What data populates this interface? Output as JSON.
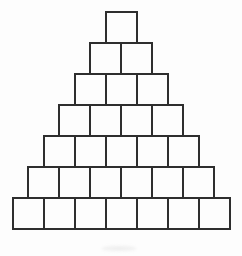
{
  "figure": {
    "rows_of_squares": [
      1,
      2,
      3,
      4,
      5,
      6,
      7
    ],
    "total_squares": 28,
    "square_size_px": 33,
    "line_color": "#2e2e2e",
    "background_color": "#fdfdfd"
  }
}
